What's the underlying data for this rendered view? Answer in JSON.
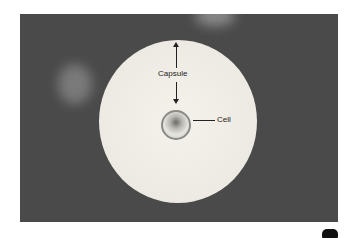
{
  "figure": {
    "labels": {
      "capsule": "Capsule",
      "cell": "Cell"
    },
    "colors": {
      "background": "#4a4a4a",
      "capsule": "#f0eee6",
      "label_text": "#222222"
    }
  }
}
